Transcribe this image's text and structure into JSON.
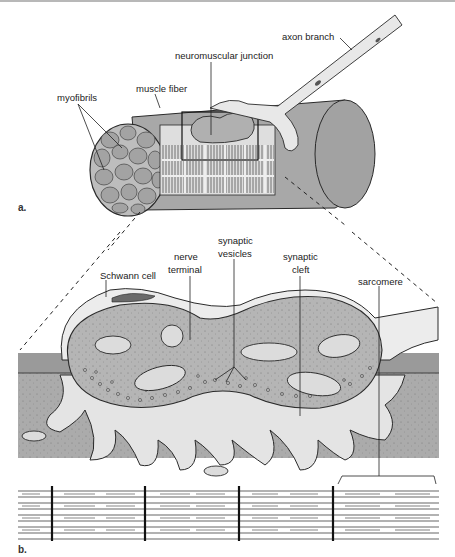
{
  "figure": {
    "panel_a": {
      "panel_label": "a.",
      "labels": {
        "axon_branch": "axon branch",
        "neuromuscular_junction": "neuromuscular junction",
        "muscle_fiber": "muscle fiber",
        "myofibrils": "myofibrils"
      }
    },
    "panel_b": {
      "panel_label": "b.",
      "labels": {
        "synaptic_vesicles_1": "synaptic",
        "synaptic_vesicles_2": "vesicles",
        "nerve_terminal_1": "nerve",
        "nerve_terminal_2": "terminal",
        "schwann_cell": "Schwann cell",
        "synaptic_cleft_1": "synaptic",
        "synaptic_cleft_2": "cleft",
        "sarcomere": "sarcomere"
      }
    },
    "colors": {
      "muscle_fill": "#a9a9a9",
      "muscle_dark": "#8f8f8f",
      "terminal_fill": "#b3b3b3",
      "schwann_fill": "#eaeaea",
      "cleft_fill": "#e6e6e6",
      "outline": "#2a2a2a"
    }
  }
}
